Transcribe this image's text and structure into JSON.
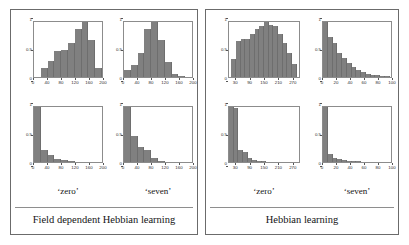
{
  "figure": {
    "background": "#ffffff",
    "bar_color": "#808080",
    "axis_color": "#8c8c8c",
    "frame_color": "#6b6b6b"
  },
  "boxes": [
    {
      "id": "field-dependent-hebbian",
      "caption": "Field dependent Hebbian learning",
      "column_labels": [
        "‘zero’",
        "‘seven’"
      ]
    },
    {
      "id": "hebbian",
      "caption": "Hebbian learning",
      "column_labels": [
        "‘zero’",
        "‘seven’"
      ]
    }
  ],
  "chart_data": [
    {
      "type": "bar",
      "panel": "left-box-top-left",
      "title": "",
      "group": "Field dependent Hebbian learning",
      "column": "‘zero’",
      "row": "top",
      "xlabel": "",
      "ylabel": "",
      "xlim": [
        0,
        200
      ],
      "ylim": [
        0,
        1
      ],
      "xticks": [
        0,
        40,
        80,
        120,
        160,
        200
      ],
      "xtick_labels": [
        "0",
        "40",
        "80",
        "120",
        "160",
        "200"
      ],
      "yticks": [
        0,
        0.5,
        1
      ],
      "ytick_labels": [
        "0",
        "0.5",
        "1"
      ],
      "grid": false,
      "bin_width": 20,
      "bin_centers": [
        10,
        30,
        50,
        70,
        90,
        110,
        130,
        150,
        170,
        190
      ],
      "values": [
        0.0,
        0.17,
        0.3,
        0.47,
        0.5,
        0.62,
        0.88,
        1.0,
        0.68,
        0.17
      ]
    },
    {
      "type": "bar",
      "panel": "left-box-top-right",
      "group": "Field dependent Hebbian learning",
      "column": "‘seven’",
      "row": "top",
      "xlim": [
        0,
        200
      ],
      "ylim": [
        0,
        1
      ],
      "xticks": [
        0,
        40,
        80,
        120,
        160,
        200
      ],
      "xtick_labels": [
        "0",
        "40",
        "80",
        "120",
        "160",
        "200"
      ],
      "yticks": [
        0,
        0.5,
        1
      ],
      "ytick_labels": [
        "0",
        "0.5",
        "1"
      ],
      "grid": false,
      "bin_width": 20,
      "bin_centers": [
        10,
        30,
        50,
        70,
        90,
        110,
        130,
        150,
        170,
        190
      ],
      "values": [
        0.12,
        0.22,
        0.43,
        0.87,
        1.0,
        0.68,
        0.28,
        0.05,
        0.02,
        0.0
      ]
    },
    {
      "type": "bar",
      "panel": "left-box-bottom-left",
      "group": "Field dependent Hebbian learning",
      "column": "‘zero’",
      "row": "bottom",
      "xlim": [
        0,
        200
      ],
      "ylim": [
        0,
        1
      ],
      "xticks": [
        0,
        40,
        80,
        120,
        160,
        200
      ],
      "xtick_labels": [
        "0",
        "40",
        "80",
        "120",
        "160",
        "200"
      ],
      "yticks": [
        0,
        0.5,
        1
      ],
      "ytick_labels": [
        "0",
        "0.5",
        "1"
      ],
      "grid": false,
      "bin_width": 20,
      "bin_centers": [
        10,
        30,
        50,
        70,
        90,
        110,
        130,
        150,
        170,
        190
      ],
      "values": [
        1.0,
        0.21,
        0.13,
        0.05,
        0.03,
        0.01,
        0.0,
        0.0,
        0.0,
        0.0
      ]
    },
    {
      "type": "bar",
      "panel": "left-box-bottom-right",
      "group": "Field dependent Hebbian learning",
      "column": "‘seven’",
      "row": "bottom",
      "xlim": [
        0,
        200
      ],
      "ylim": [
        0,
        1
      ],
      "xticks": [
        0,
        40,
        80,
        120,
        160,
        200
      ],
      "xtick_labels": [
        "0",
        "40",
        "80",
        "120",
        "160",
        "200"
      ],
      "yticks": [
        0,
        0.5,
        1
      ],
      "ytick_labels": [
        "0",
        "0.5",
        "1"
      ],
      "grid": false,
      "bin_width": 20,
      "bin_centers": [
        10,
        30,
        50,
        70,
        90,
        110,
        130,
        150,
        170,
        190
      ],
      "values": [
        1.0,
        0.48,
        0.27,
        0.21,
        0.08,
        0.02,
        0.0,
        0.0,
        0.0,
        0.0
      ]
    },
    {
      "type": "bar",
      "panel": "right-box-top-left",
      "group": "Hebbian learning",
      "column": "‘zero’",
      "row": "top",
      "xlim": [
        0,
        300
      ],
      "ylim": [
        0,
        1
      ],
      "xticks": [
        30,
        90,
        150,
        210,
        270
      ],
      "xtick_labels": [
        "30",
        "90",
        "150",
        "210",
        "270"
      ],
      "yticks": [
        0,
        0.5,
        1
      ],
      "ytick_labels": [
        "0",
        "0.5",
        "1"
      ],
      "grid": false,
      "bin_width": 20,
      "bin_centers": [
        20,
        40,
        60,
        80,
        100,
        120,
        140,
        160,
        180,
        200,
        220,
        240,
        260,
        280
      ],
      "values": [
        0.33,
        0.66,
        0.69,
        0.7,
        0.78,
        0.87,
        0.93,
        1.0,
        0.94,
        0.92,
        0.78,
        0.62,
        0.43,
        0.24
      ]
    },
    {
      "type": "bar",
      "panel": "right-box-top-right",
      "group": "Hebbian learning",
      "column": "‘seven’",
      "row": "top",
      "xlim": [
        0,
        100
      ],
      "ylim": [
        0,
        1
      ],
      "xticks": [
        0,
        20,
        40,
        60,
        80,
        100
      ],
      "xtick_labels": [
        "0",
        "20",
        "40",
        "60",
        "80",
        "100"
      ],
      "yticks": [
        0,
        0.5,
        1
      ],
      "ytick_labels": [
        "0",
        "0.5",
        "1"
      ],
      "grid": false,
      "bin_width": 7,
      "bin_centers": [
        3.5,
        10.5,
        17.5,
        24.5,
        31.5,
        38.5,
        45.5,
        52.5,
        59.5,
        66.5,
        73.5,
        80.5,
        87.5,
        94.5
      ],
      "values": [
        1.0,
        0.73,
        0.62,
        0.44,
        0.34,
        0.26,
        0.19,
        0.12,
        0.09,
        0.06,
        0.04,
        0.03,
        0.02,
        0.01
      ]
    },
    {
      "type": "bar",
      "panel": "right-box-bottom-left",
      "group": "Hebbian learning",
      "column": "‘zero’",
      "row": "bottom",
      "xlim": [
        0,
        300
      ],
      "ylim": [
        0,
        1
      ],
      "xticks": [
        30,
        90,
        150,
        210,
        270
      ],
      "xtick_labels": [
        "30",
        "90",
        "150",
        "210",
        "270"
      ],
      "yticks": [
        0,
        0.5,
        1
      ],
      "ytick_labels": [
        "0",
        "0.5",
        "1"
      ],
      "grid": false,
      "bin_width": 20,
      "bin_centers": [
        10,
        30,
        50,
        70,
        90,
        110,
        130,
        150,
        170,
        190,
        210,
        230,
        250,
        270
      ],
      "values": [
        1.0,
        0.98,
        0.21,
        0.18,
        0.07,
        0.04,
        0.02,
        0.01,
        0.0,
        0.0,
        0.0,
        0.0,
        0.0,
        0.0
      ]
    },
    {
      "type": "bar",
      "panel": "right-box-bottom-right",
      "group": "Hebbian learning",
      "column": "‘seven’",
      "row": "bottom",
      "xlim": [
        0,
        100
      ],
      "ylim": [
        0,
        1
      ],
      "xticks": [
        0,
        20,
        40,
        60,
        80,
        100
      ],
      "xtick_labels": [
        "0",
        "20",
        "40",
        "60",
        "80",
        "100"
      ],
      "yticks": [
        0,
        0.5,
        1
      ],
      "ytick_labels": [
        "0",
        "0.5",
        "1"
      ],
      "grid": false,
      "bin_width": 7,
      "bin_centers": [
        3.5,
        10.5,
        17.5,
        24.5,
        31.5,
        38.5,
        45.5,
        52.5,
        59.5,
        66.5,
        73.5,
        80.5,
        87.5,
        94.5
      ],
      "values": [
        1.0,
        0.14,
        0.07,
        0.05,
        0.03,
        0.02,
        0.015,
        0.01,
        0.0,
        0.0,
        0.0,
        0.0,
        0.0,
        0.0
      ]
    }
  ]
}
